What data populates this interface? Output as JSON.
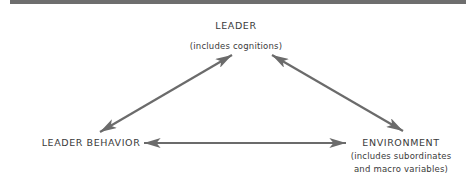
{
  "diagram": {
    "type": "triangle-relationship",
    "nodes": [
      {
        "id": "leader",
        "title": "LEADER",
        "subtitle_lines": [
          "(includes cognitions)"
        ]
      },
      {
        "id": "leader-behavior",
        "title": "LEADER BEHAVIOR",
        "subtitle_lines": []
      },
      {
        "id": "environment",
        "title": "ENVIRONMENT",
        "subtitle_lines": [
          "(includes subordinates",
          "and macro variables)"
        ]
      }
    ],
    "edges": [
      {
        "from": "leader",
        "to": "leader-behavior",
        "direction": "bidirectional"
      },
      {
        "from": "leader",
        "to": "environment",
        "direction": "bidirectional"
      },
      {
        "from": "leader-behavior",
        "to": "environment",
        "direction": "bidirectional"
      }
    ],
    "colors": {
      "arrow": "#6b6b6b",
      "text": "#3a3a3a",
      "top_bar": "#6e6e6e"
    }
  }
}
